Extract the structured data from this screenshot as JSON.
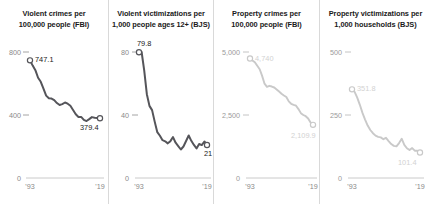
{
  "figure": {
    "width": 431,
    "height": 204,
    "background": "#ffffff",
    "dark_series_color": "#55555a",
    "light_series_color": "#c9c9c9",
    "axis_color": "#c4c4c4",
    "divider_color": "#d9d9d9",
    "tick_text_color": "#8a8a8a"
  },
  "chart_data": [
    {
      "type": "line",
      "panel_index": 0,
      "title": "Violent crimes per\n100,000 people (FBI)",
      "title_line1": "Violent crimes per",
      "title_line2": "100,000 people (FBI)",
      "xlabel": "",
      "ylabel": "",
      "ylim": [
        0,
        800
      ],
      "xlim": [
        1993,
        2019
      ],
      "yticks": [
        0,
        400,
        800
      ],
      "ytick_labels": [
        "0",
        "400",
        "800"
      ],
      "xticks": [
        1993,
        2019
      ],
      "xtick_labels": [
        "'93",
        "'19"
      ],
      "grid": false,
      "legend": "none",
      "emphasis": "dark",
      "series_color": "#55555a",
      "start_label": "747.1",
      "end_label": "379.4",
      "start_value": 747.1,
      "end_value": 379.4,
      "x": [
        1993,
        1994,
        1995,
        1996,
        1997,
        1998,
        1999,
        2000,
        2001,
        2002,
        2003,
        2004,
        2005,
        2006,
        2007,
        2008,
        2009,
        2010,
        2011,
        2012,
        2013,
        2014,
        2015,
        2016,
        2017,
        2018,
        2019
      ],
      "values": [
        747.1,
        713.6,
        684.5,
        636.6,
        611.0,
        567.6,
        523.0,
        506.5,
        504.5,
        494.4,
        475.8,
        463.2,
        469.0,
        479.3,
        471.8,
        458.6,
        431.9,
        404.5,
        387.1,
        387.8,
        369.1,
        361.6,
        373.7,
        386.6,
        382.9,
        380.6,
        379.4
      ]
    },
    {
      "type": "line",
      "panel_index": 1,
      "title": "Violent victimizations per\n1,000 people ages 12+ (BJS)",
      "title_line1": "Violent victimizations per",
      "title_line2": "1,000 people ages 12+ (BJS)",
      "xlabel": "",
      "ylabel": "",
      "ylim": [
        0,
        80
      ],
      "xlim": [
        1993,
        2019
      ],
      "yticks": [
        0,
        40,
        80
      ],
      "ytick_labels": [
        "0",
        "40",
        "80"
      ],
      "xticks": [
        1993,
        2019
      ],
      "xtick_labels": [
        "'93",
        "'19"
      ],
      "grid": false,
      "legend": "none",
      "emphasis": "dark",
      "series_color": "#55555a",
      "start_label": "79.8",
      "end_label": "21",
      "start_value": 79.8,
      "end_value": 21,
      "x": [
        1993,
        1994,
        1995,
        1996,
        1997,
        1998,
        1999,
        2000,
        2001,
        2002,
        2003,
        2004,
        2005,
        2006,
        2007,
        2008,
        2009,
        2010,
        2011,
        2012,
        2013,
        2014,
        2015,
        2016,
        2017,
        2018,
        2019
      ],
      "values": [
        79.8,
        80.0,
        68.2,
        53.2,
        45.8,
        43.1,
        35.8,
        29.1,
        26.8,
        24.0,
        23.3,
        22.0,
        23.4,
        26.0,
        22.4,
        20.3,
        18.1,
        20.0,
        23.5,
        27.0,
        23.6,
        21.0,
        18.8,
        21.6,
        20.9,
        23.2,
        21.0
      ]
    },
    {
      "type": "line",
      "panel_index": 2,
      "title": "Property crimes per\n100,000 people (FBI)",
      "title_line1": "Property crimes per",
      "title_line2": "100,000 people (FBI)",
      "xlabel": "",
      "ylabel": "",
      "ylim": [
        0,
        5000
      ],
      "xlim": [
        1993,
        2019
      ],
      "yticks": [
        0,
        2500,
        5000
      ],
      "ytick_labels": [
        "0",
        "2,500",
        "5,000"
      ],
      "xticks": [
        1993,
        2019
      ],
      "xtick_labels": [
        "'93",
        "'19"
      ],
      "grid": false,
      "legend": "none",
      "emphasis": "light",
      "series_color": "#c9c9c9",
      "start_label": "4,740",
      "end_label": "2,109.9",
      "start_value": 4740,
      "end_value": 2109.9,
      "x": [
        1993,
        1994,
        1995,
        1996,
        1997,
        1998,
        1999,
        2000,
        2001,
        2002,
        2003,
        2004,
        2005,
        2006,
        2007,
        2008,
        2009,
        2010,
        2011,
        2012,
        2013,
        2014,
        2015,
        2016,
        2017,
        2018,
        2019
      ],
      "values": [
        4740.0,
        4660.2,
        4590.5,
        4451.0,
        4316.3,
        4052.5,
        3743.6,
        3618.3,
        3658.1,
        3630.6,
        3591.2,
        3514.1,
        3431.5,
        3346.6,
        3276.4,
        3214.6,
        3041.3,
        2945.9,
        2905.4,
        2868.0,
        2733.6,
        2574.1,
        2500.5,
        2451.6,
        2362.2,
        2199.5,
        2109.9
      ]
    },
    {
      "type": "line",
      "panel_index": 3,
      "title": "Property victimizations per\n1,000 households (BJS)",
      "title_line1": "Property victimizations per",
      "title_line2": "1,000 households (BJS)",
      "xlabel": "",
      "ylabel": "",
      "ylim": [
        0,
        500
      ],
      "xlim": [
        1993,
        2019
      ],
      "yticks": [
        0,
        250,
        500
      ],
      "ytick_labels": [
        "0",
        "250",
        "500"
      ],
      "xticks": [
        1993,
        2019
      ],
      "xtick_labels": [
        "'93",
        "'19"
      ],
      "grid": false,
      "legend": "none",
      "emphasis": "light",
      "series_color": "#c9c9c9",
      "start_label": "351.8",
      "end_label": "101.4",
      "start_value": 351.8,
      "end_value": 101.4,
      "x": [
        1993,
        1994,
        1995,
        1996,
        1997,
        1998,
        1999,
        2000,
        2001,
        2002,
        2003,
        2004,
        2005,
        2006,
        2007,
        2008,
        2009,
        2010,
        2011,
        2012,
        2013,
        2014,
        2015,
        2016,
        2017,
        2018,
        2019
      ],
      "values": [
        351.8,
        341.5,
        318.8,
        290.4,
        258.4,
        232.0,
        208.3,
        190.4,
        177.7,
        168.2,
        163.2,
        161.1,
        154.1,
        159.5,
        146.5,
        134.7,
        127.4,
        125.4,
        138.7,
        155.8,
        131.4,
        118.1,
        110.7,
        118.6,
        108.4,
        108.2,
        101.4
      ]
    }
  ]
}
